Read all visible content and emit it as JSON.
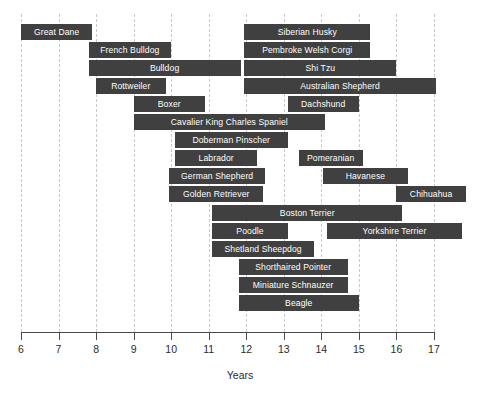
{
  "chart_data": {
    "type": "bar",
    "orientation": "horizontal",
    "subtype": "range-bar",
    "title": "",
    "xlabel": "Years",
    "ylabel": "",
    "xlim": [
      6,
      17
    ],
    "xticks": [
      6,
      7,
      8,
      9,
      10,
      11,
      12,
      13,
      14,
      15,
      16,
      17
    ],
    "xtick_labels": [
      "6",
      "7",
      "8",
      "9",
      "10",
      "11",
      "12",
      "13",
      "14",
      "15",
      "16",
      "17"
    ],
    "grid": "vertical-dashed",
    "legend": "none",
    "bar_color": "#404040",
    "label_color": "#ffffff",
    "grid_color": "#c9c9c9",
    "axis_color": "#4a4a4a",
    "categories": [
      "Great Dane",
      "Siberian Husky",
      "French Bulldog",
      "Pembroke Welsh Corgi",
      "Bulldog",
      "Shi Tzu",
      "Rottweiler",
      "Australian Shepherd",
      "Boxer",
      "Dachshund",
      "Cavalier King Charles Spaniel",
      "Doberman Pinscher",
      "Labrador",
      "Pomeranian",
      "German Shepherd",
      "Havanese",
      "Golden Retriever",
      "Chihuahua",
      "Boston Terrier",
      "Poodle",
      "Yorkshire Terrier",
      "Shetland Sheepdog",
      "Shorthaired Pointer",
      "Miniature Schnauzer",
      "Beagle"
    ],
    "bars": [
      {
        "row": 0,
        "label": "Great Dane",
        "start": 6.0,
        "end": 7.9
      },
      {
        "row": 0,
        "label": "Siberian Husky",
        "start": 11.95,
        "end": 15.3
      },
      {
        "row": 1,
        "label": "French Bulldog",
        "start": 7.8,
        "end": 10.0
      },
      {
        "row": 1,
        "label": "Pembroke Welsh Corgi",
        "start": 11.95,
        "end": 15.3
      },
      {
        "row": 2,
        "label": "Bulldog",
        "start": 7.8,
        "end": 11.85
      },
      {
        "row": 2,
        "label": "Shi Tzu",
        "start": 11.95,
        "end": 16.0
      },
      {
        "row": 3,
        "label": "Rottweiler",
        "start": 8.0,
        "end": 9.85
      },
      {
        "row": 3,
        "label": "Australian Shepherd",
        "start": 11.95,
        "end": 17.05
      },
      {
        "row": 4,
        "label": "Boxer",
        "start": 9.0,
        "end": 10.9
      },
      {
        "row": 4,
        "label": "Dachshund",
        "start": 13.1,
        "end": 15.0
      },
      {
        "row": 5,
        "label": "Cavalier King Charles Spaniel",
        "start": 9.0,
        "end": 14.1
      },
      {
        "row": 6,
        "label": "Doberman Pinscher",
        "start": 10.1,
        "end": 13.1
      },
      {
        "row": 7,
        "label": "Labrador",
        "start": 10.1,
        "end": 12.3
      },
      {
        "row": 7,
        "label": "Pomeranian",
        "start": 13.4,
        "end": 15.1
      },
      {
        "row": 8,
        "label": "German Shepherd",
        "start": 9.95,
        "end": 12.5
      },
      {
        "row": 8,
        "label": "Havanese",
        "start": 14.05,
        "end": 16.3
      },
      {
        "row": 9,
        "label": "Golden Retriever",
        "start": 9.95,
        "end": 12.45
      },
      {
        "row": 9,
        "label": "Chihuahua",
        "start": 16.0,
        "end": 17.85
      },
      {
        "row": 10,
        "label": "Boston Terrier",
        "start": 11.1,
        "end": 16.15
      },
      {
        "row": 11,
        "label": "Poodle",
        "start": 11.1,
        "end": 13.1
      },
      {
        "row": 11,
        "label": "Yorkshire Terrier",
        "start": 14.15,
        "end": 17.75
      },
      {
        "row": 12,
        "label": "Shetland Sheepdog",
        "start": 11.1,
        "end": 13.8
      },
      {
        "row": 13,
        "label": "Shorthaired Pointer",
        "start": 11.8,
        "end": 14.7
      },
      {
        "row": 14,
        "label": "Miniature Schnauzer",
        "start": 11.8,
        "end": 14.7
      },
      {
        "row": 15,
        "label": "Beagle",
        "start": 11.8,
        "end": 15.0
      }
    ]
  },
  "axis": {
    "x_title": "Years"
  }
}
